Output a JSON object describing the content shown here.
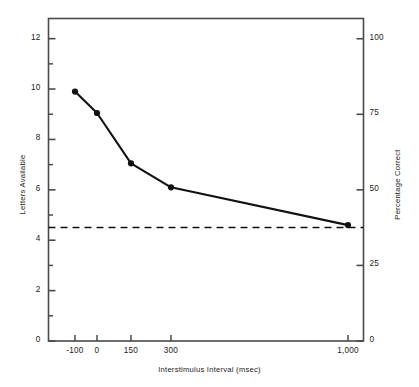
{
  "chart_data": {
    "type": "line",
    "title": "",
    "xlabel": "Interstimulus Interval (msec)",
    "ylabel": "Letters Available",
    "y2label": "Percentage Correct",
    "grid": false,
    "legend": "none",
    "x_tick_labels": [
      "-100",
      "0",
      "150",
      "300",
      "1,000"
    ],
    "x_tick_values": [
      -100,
      0,
      150,
      300,
      1000
    ],
    "x_tick_positions": [
      75,
      97,
      131,
      171,
      348
    ],
    "ylim": [
      0,
      12.8
    ],
    "y_tick_labels": [
      "0",
      "2",
      "4",
      "6",
      "8",
      "10",
      "12"
    ],
    "y_tick_values": [
      0,
      2,
      4,
      6,
      8,
      10,
      12
    ],
    "y_minor_tick_values": [
      1,
      3,
      5,
      7,
      9,
      11
    ],
    "y2lim": [
      0,
      106.7
    ],
    "y2_tick_labels": [
      "0",
      "25",
      "50",
      "75",
      "100"
    ],
    "y2_tick_values": [
      0,
      25,
      50,
      75,
      100
    ],
    "series": [
      {
        "name": "Letters Available",
        "marker": "filled-circle",
        "line_color": "#111111",
        "points": [
          {
            "x_label": "-100",
            "x_pos": 75,
            "y": 9.9,
            "pct": 82.5
          },
          {
            "x_label": "0",
            "x_pos": 97,
            "y": 9.05,
            "pct": 75.4
          },
          {
            "x_label": "150",
            "x_pos": 131,
            "y": 7.05,
            "pct": 58.8
          },
          {
            "x_label": "300",
            "x_pos": 171,
            "y": 6.1,
            "pct": 50.8
          },
          {
            "x_label": "1,000",
            "x_pos": 348,
            "y": 4.6,
            "pct": 38.3
          }
        ]
      }
    ],
    "reference_line": {
      "name": "chance-baseline",
      "orientation": "horizontal",
      "y": 4.5,
      "pct": 37.5,
      "style": "dashed",
      "color": "#111111"
    },
    "colors": {
      "axis": "#4a4a4a",
      "data": "#111111",
      "text": "#1a1a1a",
      "background": "#ffffff"
    }
  }
}
